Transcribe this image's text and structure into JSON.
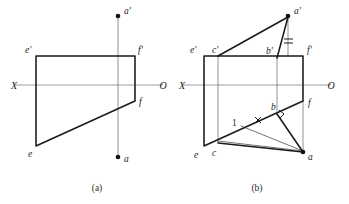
{
  "figure": {
    "background_color": "#ffffff",
    "line_color": "#1a1a1a",
    "axis_color": "#8e8e8e",
    "width": 349,
    "height": 204
  },
  "captions": {
    "left": "(a)",
    "right": "(b)"
  },
  "diagram_a": {
    "name": "diagram-a",
    "axis": {
      "left_label": "X",
      "right_label": "O",
      "y": 85,
      "x_start": 14,
      "x_end": 163
    },
    "vertical_projector": {
      "x": 118,
      "y_top": 18,
      "y_bottom": 155
    },
    "points": [
      {
        "id": "a-prime",
        "label": "a'",
        "x": 118,
        "y": 16,
        "label_x": 124,
        "label_y": 14,
        "dot": true
      },
      {
        "id": "a",
        "label": "a",
        "x": 118,
        "y": 157,
        "label_x": 124,
        "label_y": 160,
        "dot": true
      },
      {
        "id": "e-prime",
        "label": "e'",
        "x": 36,
        "y": 56,
        "label_x": 26,
        "label_y": 52,
        "dot": false
      },
      {
        "id": "f-prime",
        "label": "f'",
        "x": 135,
        "y": 56,
        "label_x": 138,
        "label_y": 52,
        "dot": false
      },
      {
        "id": "f",
        "label": "f",
        "x": 135,
        "y": 101,
        "label_x": 138,
        "label_y": 104,
        "dot": false
      },
      {
        "id": "e",
        "label": "e",
        "x": 36,
        "y": 146,
        "label_x": 29,
        "label_y": 155,
        "dot": false
      }
    ],
    "plane_outline": [
      [
        36,
        56
      ],
      [
        135,
        56
      ],
      [
        135,
        101
      ],
      [
        36,
        146
      ]
    ]
  },
  "diagram_b": {
    "name": "diagram-b",
    "axis": {
      "left_label": "X",
      "right_label": "O",
      "y": 85,
      "x_start": 182,
      "x_end": 331
    },
    "points": [
      {
        "id": "a-prime",
        "label": "a'",
        "x": 288,
        "y": 16,
        "label_x": 294,
        "label_y": 14,
        "dot": true
      },
      {
        "id": "a",
        "label": "a",
        "x": 303,
        "y": 153,
        "label_x": 308,
        "label_y": 159,
        "dot": true
      },
      {
        "id": "b-prime",
        "label": "b'",
        "x": 277,
        "y": 56,
        "label_x": 268,
        "label_y": 53,
        "dot": false
      },
      {
        "id": "b",
        "label": "b",
        "x": 277,
        "y": 114,
        "label_x": 272,
        "label_y": 110,
        "dot": false
      },
      {
        "id": "c-prime",
        "label": "c'",
        "x": 218,
        "y": 56,
        "label_x": 215,
        "label_y": 52,
        "dot": false
      },
      {
        "id": "c",
        "label": "c",
        "x": 218,
        "y": 143,
        "label_x": 214,
        "label_y": 155,
        "dot": false
      },
      {
        "id": "e-prime",
        "label": "e'",
        "x": 204,
        "y": 56,
        "label_x": 192,
        "label_y": 52,
        "dot": false
      },
      {
        "id": "e",
        "label": "e",
        "x": 204,
        "y": 146,
        "label_x": 195,
        "label_y": 157,
        "dot": false
      },
      {
        "id": "f-prime",
        "label": "f'",
        "x": 303,
        "y": 56,
        "label_x": 307,
        "label_y": 52,
        "dot": false
      },
      {
        "id": "f",
        "label": "f",
        "x": 303,
        "y": 101,
        "label_x": 308,
        "label_y": 105,
        "dot": false
      },
      {
        "id": "point-1",
        "label": "1",
        "x": 241,
        "y": 124,
        "label_x": 234,
        "label_y": 123,
        "dot": false
      }
    ],
    "plane_outline": [
      [
        204,
        56
      ],
      [
        303,
        56
      ],
      [
        303,
        101
      ],
      [
        204,
        146
      ]
    ],
    "annotations": {
      "equal_marks_label": "equal-length-hatch",
      "right_angle_label": "right-angle-marker",
      "tick_label": "segment-tick-mark"
    }
  }
}
